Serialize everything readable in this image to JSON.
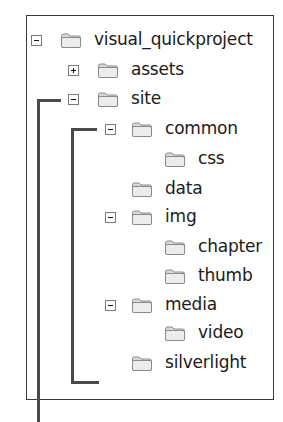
{
  "tree": {
    "nodes": [
      {
        "label": "visual_quickproject",
        "level": 0,
        "toggle": "minus",
        "y": 41
      },
      {
        "label": "assets",
        "level": 1,
        "toggle": "plus",
        "y": 71
      },
      {
        "label": "site",
        "level": 1,
        "toggle": "minus",
        "y": 100
      },
      {
        "label": "common",
        "level": 2,
        "toggle": "minus",
        "y": 130
      },
      {
        "label": "css",
        "level": 3,
        "toggle": "none",
        "y": 160
      },
      {
        "label": "data",
        "level": 2,
        "toggle": "none",
        "y": 190
      },
      {
        "label": "img",
        "level": 2,
        "toggle": "minus",
        "y": 218
      },
      {
        "label": "chapter",
        "level": 3,
        "toggle": "none",
        "y": 248
      },
      {
        "label": "thumb",
        "level": 3,
        "toggle": "none",
        "y": 277
      },
      {
        "label": "media",
        "level": 2,
        "toggle": "minus",
        "y": 306
      },
      {
        "label": "video",
        "level": 3,
        "toggle": "none",
        "y": 334
      },
      {
        "label": "silverlight",
        "level": 2,
        "toggle": "none",
        "y": 364
      }
    ]
  },
  "icons": {
    "folder": "folder-icon",
    "expand": "plus-box-icon",
    "collapse": "minus-box-icon"
  },
  "colors": {
    "panel_border": "#3a3a3a",
    "callout_line": "#4a4a4a",
    "toggle_border": "#7a7a7a",
    "folder_body": "#d8d8d8",
    "folder_edge": "#8a8a8a"
  }
}
